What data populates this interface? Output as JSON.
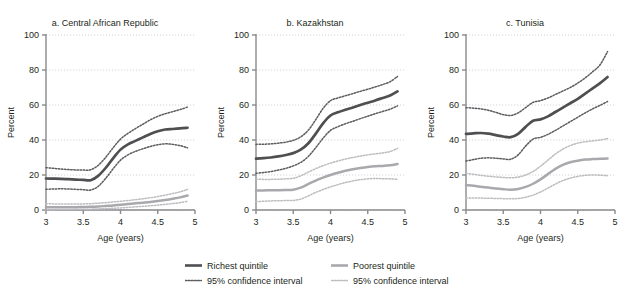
{
  "figure": {
    "caption_fragment": "",
    "y_axis_label": "Percent",
    "x_axis_label": "Age (years)",
    "y_ticks": [
      "0",
      "20",
      "40",
      "60",
      "80",
      "100"
    ],
    "x_ticks": [
      "3",
      "3.5",
      "4",
      "4.5",
      "5"
    ]
  },
  "legend": {
    "richest_line": "Richest quintile",
    "richest_ci": "95% confidence interval",
    "poorest_line": "Poorest quintile",
    "poorest_ci": "95% confidence interval"
  },
  "colors": {
    "richest": "#4f4f52",
    "richest_ci": "#5c5c60",
    "poorest": "#a9a9ad",
    "poorest_ci": "#bdbdc1",
    "grid": "#c9c9cd",
    "axis": "#8a8a8e",
    "text": "#231f20"
  },
  "panel_titles": {
    "a": "a. Central African Republic",
    "b": "b. Kazakhstan",
    "c": "c. Tunisia"
  },
  "chart_data": [
    {
      "type": "line",
      "title": "a. Central African Republic",
      "xlabel": "Age (years)",
      "ylabel": "Percent",
      "xlim": [
        3,
        5
      ],
      "ylim": [
        0,
        100
      ],
      "xticks": [
        3,
        3.5,
        4,
        4.5,
        5
      ],
      "yticks": [
        0,
        20,
        40,
        60,
        80,
        100
      ],
      "grid": true,
      "legend_position": "below-figure",
      "x": [
        3.0,
        3.1,
        3.2,
        3.3,
        3.4,
        3.5,
        3.6,
        3.7,
        3.8,
        3.9,
        4.0,
        4.1,
        4.2,
        4.3,
        4.4,
        4.5,
        4.6,
        4.7,
        4.8,
        4.9
      ],
      "series": [
        {
          "name": "Richest quintile",
          "values": [
            18.0,
            17.9,
            17.8,
            17.6,
            17.4,
            17.2,
            17.0,
            19.5,
            24.0,
            29.5,
            34.5,
            37.5,
            39.5,
            41.5,
            43.5,
            45.0,
            46.0,
            46.3,
            46.6,
            47.0
          ]
        },
        {
          "name": "Richest quintile 95% CI upper",
          "values": [
            24.2,
            23.8,
            23.4,
            23.1,
            22.9,
            22.8,
            23.0,
            25.5,
            30.0,
            35.5,
            40.5,
            43.8,
            46.5,
            49.0,
            51.5,
            53.5,
            55.0,
            56.2,
            57.4,
            58.8
          ]
        },
        {
          "name": "Richest quintile 95% CI lower",
          "values": [
            11.8,
            12.0,
            12.1,
            12.0,
            11.8,
            11.6,
            11.4,
            13.5,
            18.0,
            23.5,
            28.5,
            31.5,
            33.5,
            35.0,
            36.3,
            37.3,
            37.8,
            37.5,
            36.8,
            35.5
          ]
        },
        {
          "name": "Poorest quintile",
          "values": [
            1.6,
            1.6,
            1.6,
            1.6,
            1.6,
            1.7,
            1.8,
            2.0,
            2.3,
            2.6,
            3.0,
            3.4,
            3.8,
            4.2,
            4.6,
            5.1,
            5.7,
            6.4,
            7.2,
            8.3
          ]
        },
        {
          "name": "Poorest quintile 95% CI upper",
          "values": [
            3.6,
            3.5,
            3.4,
            3.4,
            3.4,
            3.5,
            3.6,
            3.9,
            4.2,
            4.6,
            5.0,
            5.4,
            5.9,
            6.4,
            7.0,
            7.7,
            8.5,
            9.4,
            10.4,
            11.8
          ]
        },
        {
          "name": "Poorest quintile 95% CI lower",
          "values": [
            0.2,
            0.2,
            0.3,
            0.3,
            0.4,
            0.4,
            0.5,
            0.6,
            0.8,
            1.0,
            1.2,
            1.5,
            1.8,
            2.1,
            2.4,
            2.8,
            3.2,
            3.7,
            4.2,
            5.0
          ]
        }
      ]
    },
    {
      "type": "line",
      "title": "b. Kazakhstan",
      "xlabel": "Age (years)",
      "ylabel": "Percent",
      "xlim": [
        3,
        5
      ],
      "ylim": [
        0,
        100
      ],
      "xticks": [
        3,
        3.5,
        4,
        4.5,
        5
      ],
      "yticks": [
        0,
        20,
        40,
        60,
        80,
        100
      ],
      "grid": true,
      "legend_position": "below-figure",
      "x": [
        3.0,
        3.1,
        3.2,
        3.3,
        3.4,
        3.5,
        3.6,
        3.7,
        3.8,
        3.9,
        4.0,
        4.1,
        4.2,
        4.3,
        4.4,
        4.5,
        4.6,
        4.7,
        4.8,
        4.9
      ],
      "series": [
        {
          "name": "Richest quintile",
          "values": [
            29.3,
            29.6,
            30.0,
            30.6,
            31.4,
            32.5,
            34.5,
            38.0,
            43.5,
            49.5,
            54.0,
            55.8,
            57.3,
            58.6,
            60.0,
            61.3,
            62.6,
            64.0,
            65.4,
            67.8
          ]
        },
        {
          "name": "Richest quintile 95% CI upper",
          "values": [
            37.5,
            37.6,
            37.8,
            38.2,
            38.8,
            39.8,
            41.8,
            45.5,
            51.5,
            58.0,
            62.5,
            64.0,
            65.3,
            66.5,
            67.8,
            69.0,
            70.3,
            71.7,
            73.3,
            76.3
          ]
        },
        {
          "name": "Richest quintile 95% CI lower",
          "values": [
            21.0,
            21.4,
            22.0,
            22.8,
            23.8,
            25.2,
            27.2,
            30.5,
            35.5,
            41.0,
            45.5,
            47.6,
            49.3,
            50.7,
            52.2,
            53.6,
            55.0,
            56.3,
            57.6,
            59.5
          ]
        },
        {
          "name": "Poorest quintile",
          "values": [
            11.2,
            11.2,
            11.3,
            11.3,
            11.4,
            11.6,
            12.8,
            14.8,
            16.8,
            18.5,
            20.0,
            21.3,
            22.4,
            23.3,
            24.0,
            24.6,
            25.0,
            25.2,
            25.6,
            26.3
          ]
        },
        {
          "name": "Poorest quintile 95% CI upper",
          "values": [
            17.6,
            17.5,
            17.5,
            17.6,
            17.8,
            18.1,
            19.5,
            21.6,
            23.6,
            25.3,
            26.8,
            28.0,
            29.1,
            30.0,
            30.8,
            31.5,
            32.1,
            32.6,
            33.4,
            35.2
          ]
        },
        {
          "name": "Poorest quintile 95% CI lower",
          "values": [
            4.8,
            5.0,
            5.2,
            5.3,
            5.4,
            5.5,
            6.2,
            8.0,
            10.0,
            11.7,
            13.2,
            14.5,
            15.7,
            16.6,
            17.3,
            17.8,
            18.0,
            17.9,
            17.8,
            17.5
          ]
        }
      ]
    },
    {
      "type": "line",
      "title": "c. Tunisia",
      "xlabel": "Age (years)",
      "ylabel": "Percent",
      "xlim": [
        3,
        5
      ],
      "ylim": [
        0,
        100
      ],
      "xticks": [
        3,
        3.5,
        4,
        4.5,
        5
      ],
      "yticks": [
        0,
        20,
        40,
        60,
        80,
        100
      ],
      "grid": true,
      "legend_position": "below-figure",
      "x": [
        3.0,
        3.1,
        3.2,
        3.3,
        3.4,
        3.5,
        3.6,
        3.7,
        3.8,
        3.9,
        4.0,
        4.1,
        4.2,
        4.3,
        4.4,
        4.5,
        4.6,
        4.7,
        4.8,
        4.9
      ],
      "series": [
        {
          "name": "Richest quintile",
          "values": [
            43.5,
            43.8,
            44.0,
            43.6,
            42.8,
            42.0,
            41.6,
            43.5,
            47.5,
            51.0,
            51.8,
            53.5,
            56.0,
            58.5,
            61.0,
            63.5,
            66.5,
            69.5,
            72.5,
            76.0
          ]
        },
        {
          "name": "Richest quintile 95% CI upper",
          "values": [
            58.5,
            58.2,
            57.8,
            57.0,
            55.8,
            54.5,
            54.0,
            55.5,
            58.5,
            61.5,
            62.5,
            64.0,
            66.0,
            68.0,
            70.0,
            72.5,
            75.5,
            79.0,
            83.0,
            90.5
          ]
        },
        {
          "name": "Richest quintile 95% CI lower",
          "values": [
            28.0,
            28.8,
            29.6,
            29.8,
            29.6,
            29.2,
            29.0,
            31.5,
            36.5,
            40.5,
            41.5,
            43.2,
            45.5,
            48.0,
            50.5,
            53.0,
            55.5,
            57.8,
            59.8,
            62.0
          ]
        },
        {
          "name": "Poorest quintile",
          "values": [
            14.2,
            13.8,
            13.3,
            12.8,
            12.3,
            11.9,
            11.6,
            12.0,
            13.2,
            15.0,
            17.5,
            20.5,
            23.5,
            25.8,
            27.3,
            28.2,
            28.8,
            29.1,
            29.3,
            29.4
          ]
        },
        {
          "name": "Poorest quintile 95% CI upper",
          "values": [
            21.0,
            20.4,
            19.8,
            19.3,
            18.9,
            18.6,
            18.4,
            18.8,
            20.0,
            22.0,
            25.0,
            28.5,
            32.0,
            34.8,
            36.8,
            38.2,
            39.0,
            39.5,
            40.0,
            40.8
          ]
        },
        {
          "name": "Poorest quintile 95% CI lower",
          "values": [
            6.8,
            6.8,
            6.8,
            6.7,
            6.6,
            6.5,
            6.4,
            6.6,
            7.3,
            8.5,
            10.3,
            12.5,
            14.8,
            16.8,
            18.2,
            19.2,
            19.8,
            20.0,
            19.9,
            19.6
          ]
        }
      ]
    }
  ]
}
